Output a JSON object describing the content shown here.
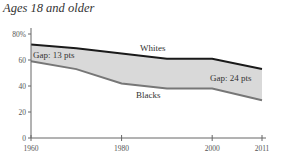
{
  "chart_data": {
    "type": "area",
    "title": "Ages 18 and older",
    "xlabel": "",
    "ylabel": "",
    "x": [
      1960,
      1970,
      1980,
      1990,
      2000,
      2011
    ],
    "series": [
      {
        "name": "Whites",
        "values": [
          72,
          69,
          65,
          61,
          61,
          53
        ],
        "color": "#1a1a1a"
      },
      {
        "name": "Blacks",
        "values": [
          59,
          53,
          42,
          38,
          38,
          29
        ],
        "color": "#777777"
      }
    ],
    "fill_between_color": "#d9d9d9",
    "x_ticks": [
      "1960",
      "1980",
      "2000",
      "2011"
    ],
    "y_ticks": [
      "0",
      "20",
      "40",
      "60",
      "80%"
    ],
    "ylim": [
      0,
      80
    ],
    "xlim": [
      1960,
      2011
    ],
    "annotations": [
      {
        "text": "Gap: 13 pts",
        "x": 1960
      },
      {
        "text": "Gap: 24 pts",
        "x": 2011
      },
      {
        "text": "Whites"
      },
      {
        "text": "Blacks"
      }
    ],
    "grid": false
  }
}
